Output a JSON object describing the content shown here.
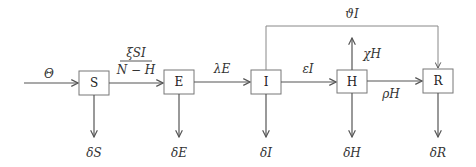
{
  "diagram": {
    "type": "compartmental-model",
    "compartments": [
      {
        "id": "S",
        "label": "S"
      },
      {
        "id": "E",
        "label": "E"
      },
      {
        "id": "I",
        "label": "I"
      },
      {
        "id": "H",
        "label": "H"
      },
      {
        "id": "R",
        "label": "R"
      }
    ],
    "flows": {
      "inflow": "Θ",
      "s_to_e_num": "ξSI",
      "s_to_e_den": "N − H",
      "e_to_i": "λE",
      "i_to_h": "εI",
      "h_to_r": "ρH",
      "h_out_up": "χH",
      "i_to_r_top": "ϑI",
      "death_s": "δS",
      "death_e": "δE",
      "death_i": "δI",
      "death_h": "δH",
      "death_r": "δR"
    }
  }
}
